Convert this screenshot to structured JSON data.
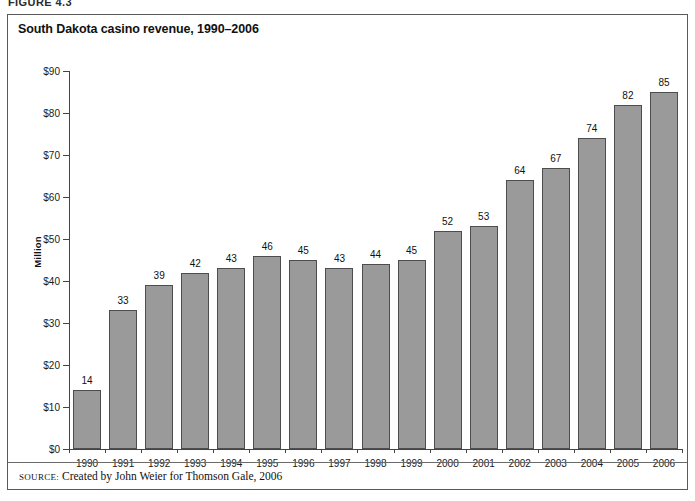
{
  "figure": {
    "label": "FIGURE 4.3"
  },
  "chart_data": {
    "type": "bar",
    "title": "South Dakota casino revenue, 1990–2006",
    "xlabel": "",
    "ylabel": "Million",
    "categories": [
      "1990",
      "1991",
      "1992",
      "1993",
      "1994",
      "1995",
      "1996",
      "1997",
      "1998",
      "1999",
      "2000",
      "2001",
      "2002",
      "2003",
      "2004",
      "2005",
      "2006"
    ],
    "values": [
      14,
      33,
      39,
      42,
      43,
      46,
      45,
      43,
      44,
      45,
      52,
      53,
      64,
      67,
      74,
      82,
      85
    ],
    "value_labels": [
      "14",
      "33",
      "39",
      "42",
      "43",
      "46",
      "45",
      "43",
      "44",
      "45",
      "52",
      "53",
      "64",
      "67",
      "74",
      "82",
      "85"
    ],
    "ylim": [
      0,
      90
    ],
    "ytick_values": [
      0,
      10,
      20,
      30,
      40,
      50,
      60,
      70,
      80,
      90
    ],
    "ytick_labels": [
      "$0",
      "$10",
      "$20",
      "$30",
      "$40",
      "$50",
      "$60",
      "$70",
      "$80",
      "$90"
    ],
    "grid": false,
    "legend": null,
    "bar_color": "#9a9a9a",
    "bar_border_color": "#4d4d4d",
    "plot_background": "#ffffff"
  },
  "source": {
    "prefix": "SOURCE:",
    "text": " Created by John Weier for Thomson Gale, 2006"
  }
}
